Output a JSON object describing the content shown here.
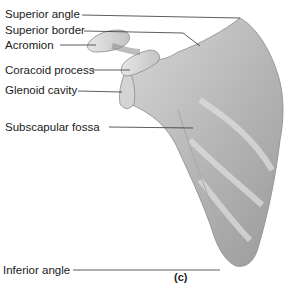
{
  "figure": {
    "subject": "scapula",
    "caption": "(c)",
    "labels": [
      {
        "id": "superior-angle",
        "text": "Superior angle"
      },
      {
        "id": "superior-border",
        "text": "Superior border"
      },
      {
        "id": "acromion",
        "text": "Acromion"
      },
      {
        "id": "coracoid-process",
        "text": "Coracoid process"
      },
      {
        "id": "glenoid-cavity",
        "text": "Glenoid cavity"
      },
      {
        "id": "subscapular-fossa",
        "text": "Subscapular fossa"
      },
      {
        "id": "inferior-angle",
        "text": "Inferior angle"
      }
    ]
  }
}
